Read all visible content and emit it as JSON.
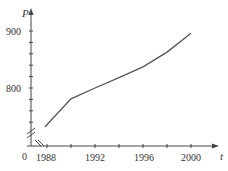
{
  "chart_data": {
    "type": "line",
    "title": "",
    "xlabel": "t",
    "ylabel": "P",
    "x": [
      1988,
      1990,
      1992,
      1994,
      1996,
      1998,
      2000
    ],
    "series": [
      {
        "name": "P",
        "values": [
          732,
          781,
          800,
          818,
          837,
          863,
          896
        ]
      }
    ],
    "x_ticks": [
      "1988",
      "1992",
      "1996",
      "2000"
    ],
    "y_ticks": [
      "800",
      "900"
    ],
    "origin_label": "0",
    "xlim": [
      1986.7,
      2002
    ],
    "ylim": [
      700,
      925
    ],
    "axis_break": true,
    "grid": false,
    "legend": "none"
  },
  "colors": {
    "line": "#555555",
    "axis": "#444444",
    "text": "#333333"
  }
}
